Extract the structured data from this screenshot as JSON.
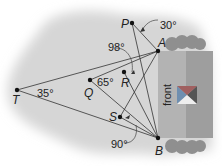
{
  "diagram": {
    "points": {
      "P": {
        "label": "P",
        "x": 132,
        "y": 23
      },
      "A": {
        "label": "A",
        "x": 158,
        "y": 51
      },
      "R": {
        "label": "R",
        "x": 124,
        "y": 72
      },
      "Q": {
        "label": "Q",
        "x": 90,
        "y": 80
      },
      "T": {
        "label": "T",
        "x": 17,
        "y": 90
      },
      "S": {
        "label": "S",
        "x": 120,
        "y": 117
      },
      "B": {
        "label": "B",
        "x": 158,
        "y": 138
      }
    },
    "angles": {
      "p": "30°",
      "r": "98°",
      "q": "65°",
      "t": "35°",
      "s": "90°"
    },
    "building": {
      "label": "front"
    },
    "colors": {
      "ground": "#d9d9d9",
      "building_left": "#b3b3b3",
      "building_right": "#9e9e9e",
      "bushes": "#8f8f8f",
      "lines": "#333333"
    }
  }
}
